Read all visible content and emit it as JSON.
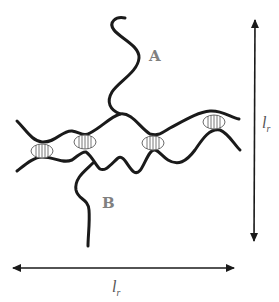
{
  "diagram": {
    "chains": [
      {
        "id": "A",
        "label": "A"
      },
      {
        "id": "B",
        "label": "B"
      }
    ],
    "crosslink_count": 4,
    "crosslink_icon": "coil-crosslink-icon",
    "dimensions": {
      "vertical": {
        "symbol": "l",
        "subscript": "r"
      },
      "horizontal": {
        "symbol": "l",
        "subscript": "r"
      }
    },
    "colors": {
      "chain": "#1a1a1a",
      "crosslink": "#6a6a6a",
      "label": "#808080",
      "background": "#ffffff"
    }
  }
}
